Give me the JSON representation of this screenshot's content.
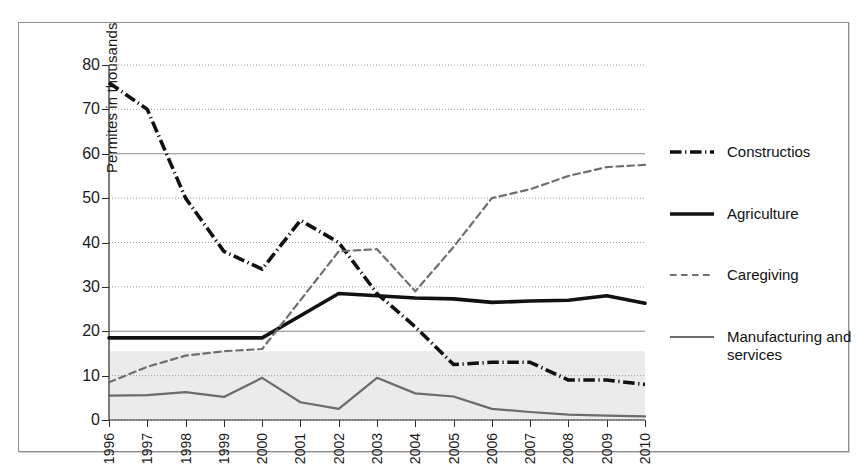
{
  "chart_data": {
    "type": "line",
    "title": "",
    "xlabel": "",
    "ylabel": "Permites in thousands",
    "x": [
      1996,
      1997,
      1998,
      1999,
      2000,
      2001,
      2002,
      2003,
      2004,
      2005,
      2006,
      2007,
      2008,
      2009,
      2010
    ],
    "xtick_labels": [
      "1996",
      "1997",
      "1998",
      "1999",
      "2000",
      "2001",
      "2002",
      "2003",
      "2004",
      "2005",
      "2006",
      "2007",
      "2008",
      "2009",
      "2010"
    ],
    "ytick_labels": [
      "0",
      "10",
      "20",
      "30",
      "40",
      "50",
      "60",
      "70",
      "80"
    ],
    "yticks": [
      0,
      10,
      20,
      30,
      40,
      50,
      60,
      70,
      80
    ],
    "ylim": [
      0,
      80
    ],
    "xlim": [
      1996,
      2010
    ],
    "grid": true,
    "legend_position": "right",
    "series": [
      {
        "name": "Constructios",
        "style": "dash-dot",
        "color": "#111111",
        "width": 3.6,
        "values": [
          76,
          70,
          50,
          38,
          34,
          45,
          40,
          28.5,
          21,
          12.5,
          13,
          13,
          9,
          9,
          8
        ]
      },
      {
        "name": "Agriculture",
        "style": "solid",
        "color": "#111111",
        "width": 3.6,
        "values": [
          18.5,
          18.5,
          18.5,
          18.5,
          18.5,
          23.5,
          28.5,
          28,
          27.5,
          27.3,
          26.5,
          26.8,
          27,
          28,
          26.3
        ]
      },
      {
        "name": "Caregiving",
        "style": "dashed",
        "color": "#6f6f6f",
        "width": 2.2,
        "values": [
          8.5,
          12,
          14.5,
          15.5,
          16,
          27,
          38,
          38.5,
          29,
          39,
          50,
          52,
          55,
          57,
          57.5
        ]
      },
      {
        "name": "Manufacturing and services",
        "style": "thin-solid",
        "color": "#6b6b6b",
        "width": 2.2,
        "values": [
          5.5,
          5.6,
          6.3,
          5.2,
          9.5,
          4,
          2.5,
          9.5,
          6,
          5.3,
          2.5,
          1.8,
          1.2,
          1,
          0.8
        ]
      }
    ],
    "shaded_band": {
      "from": 0,
      "to": 15.5,
      "color": "#ebebeb"
    }
  },
  "legend": {
    "items": [
      {
        "label": "Constructios"
      },
      {
        "label": "Agriculture"
      },
      {
        "label": "Caregiving"
      },
      {
        "label": "Manufacturing and services"
      }
    ]
  }
}
